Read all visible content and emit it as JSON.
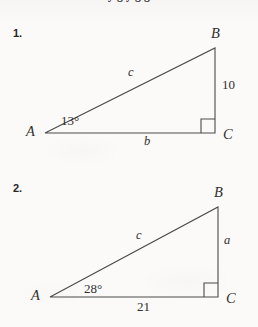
{
  "page": {
    "background_color": "#fbfaf8",
    "ink_color": "#303030",
    "cut_off_header_text": "y g y g g"
  },
  "problems": [
    {
      "number": "1.",
      "figure": {
        "type": "right-triangle",
        "vertices": {
          "A": {
            "label": "A",
            "x": 45,
            "y": 133
          },
          "B": {
            "label": "B",
            "x": 215,
            "y": 48
          },
          "C": {
            "label": "C",
            "x": 215,
            "y": 133
          }
        },
        "right_angle_at": "C",
        "angle_label": "13°",
        "angle_value": 13,
        "hypotenuse_label": "c",
        "base_label": "b",
        "vertical_label": "10",
        "vertical_value": 10
      }
    },
    {
      "number": "2.",
      "figure": {
        "type": "right-triangle",
        "vertices": {
          "A": {
            "label": "A",
            "x": 50,
            "y": 297
          },
          "B": {
            "label": "B",
            "x": 218,
            "y": 207
          },
          "C": {
            "label": "C",
            "x": 218,
            "y": 297
          }
        },
        "right_angle_at": "C",
        "angle_label": "28°",
        "angle_value": 28,
        "hypotenuse_label": "c",
        "base_label": "21",
        "base_value": 21,
        "vertical_label": "a"
      }
    }
  ]
}
